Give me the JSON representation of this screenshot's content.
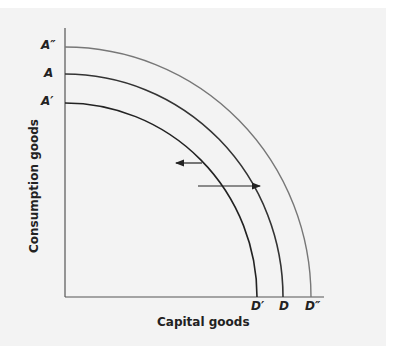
{
  "diagram": {
    "y_axis_label": "Consumption goods",
    "x_axis_label": "Capital goods",
    "curves": [
      {
        "name": "outer",
        "y_label": "A″",
        "x_label": "D″"
      },
      {
        "name": "original",
        "y_label": "A",
        "x_label": "D"
      },
      {
        "name": "inner",
        "y_label": "A′",
        "x_label": "D′"
      }
    ],
    "arrows": [
      {
        "direction": "left",
        "meaning": "inward shift"
      },
      {
        "direction": "right",
        "meaning": "outward shift"
      }
    ],
    "colors": {
      "background": "#f3f3f3",
      "line": "#333333",
      "outer_line": "#777777"
    }
  }
}
